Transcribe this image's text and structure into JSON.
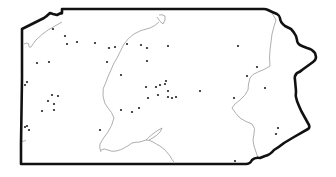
{
  "map": {
    "region": "Pennsylvania",
    "colors": {
      "background": "#ffffff",
      "outline": "#111111",
      "rivers": "#9a9a9a",
      "dots": "#222222"
    },
    "outline_path": "M22,29 L22,78 L21,144 L21,164 L246,164 Q250,164 252,160 Q255,157 260,158 L265,156 Q270,155 274,150 Q279,147 284,143 L294,137 L308,129 Q310,128 309,125 L304,116 Q301,111 299,106 L297,101 Q295,96 296,91 L295,80 Q294,76 297,73 Q300,72 302,70 L313,62 Q316,60 316,57 L315,53 Q312,49 307,48 L302,46 Q297,44 297,40 L296,36 Q294,32 291,29 L285,26 Q280,22 280,18 Q280,16 277,14 Q272,12 268,10 Q266,9 264,9 L62,9 L62,13 Q62,14 61,13 L57,15 L53,14 L50,13 Q47,16 44,18 L40,20 L22,29 Z",
    "rivers": [
      {
        "name": "allegheny-north",
        "d": "M62,22 Q55,26 48,30 Q42,34 36,40 Q33,44 31,47 Q28,48 29,44 Q27,42 24,44"
      },
      {
        "name": "west-branch-susquehanna",
        "d": "M159,22 Q155,26 150,28 Q140,30 134,34 Q128,38 124,44 Q120,52 117,58 Q113,64 111,70 Q108,76 106,82"
      },
      {
        "name": "susquehanna-main",
        "d": "M157,17 Q160,22 163,24 Q166,20 165,16 Q162,14 159,15"
      },
      {
        "name": "juniata-susquehanna",
        "d": "M106,82 Q102,88 103,96 Q104,104 108,108 Q112,112 114,118 Q112,126 108,132 Q103,138 100,144 Q99,148 101,152"
      },
      {
        "name": "potomac-headwaters",
        "d": "M101,150 Q104,148 108,150 Q112,152 116,151 Q121,150 124,148 Q128,146 132,143 Q136,142 140,142 Q143,141 146,140 Q150,140 153,142 Q156,144 160,146 Q166,150 170,156 Q172,160 174,162"
      },
      {
        "name": "potomac-loop",
        "d": "M146,140 Q150,136 154,133 Q158,130 162,128 Q161,132 157,135 Q153,138 149,140"
      },
      {
        "name": "delaware-upper",
        "d": "M270,10 Q274,16 276,20 Q274,26 272,34 Q271,42 270,50 Q269,58 270,66 Q264,70 258,72 Q252,74 250,78 Q248,84 248,90 Q245,96 240,100 Q234,104 232,108"
      },
      {
        "name": "lehigh-schuylkill",
        "d": "M232,108 Q236,114 240,118 Q246,122 252,124 Q256,128 254,134 Q252,140 254,146 Q256,152 258,158"
      },
      {
        "name": "sw-branch",
        "d": "M21,140 Q24,143 26,140"
      }
    ],
    "points": [
      {
        "x": 53,
        "y": 29
      },
      {
        "x": 65,
        "y": 36
      },
      {
        "x": 67,
        "y": 44
      },
      {
        "x": 77,
        "y": 42
      },
      {
        "x": 95,
        "y": 43
      },
      {
        "x": 109,
        "y": 48
      },
      {
        "x": 115,
        "y": 47
      },
      {
        "x": 127,
        "y": 44
      },
      {
        "x": 141,
        "y": 45
      },
      {
        "x": 147,
        "y": 48
      },
      {
        "x": 37,
        "y": 63
      },
      {
        "x": 49,
        "y": 62
      },
      {
        "x": 107,
        "y": 62
      },
      {
        "x": 147,
        "y": 61
      },
      {
        "x": 168,
        "y": 46
      },
      {
        "x": 238,
        "y": 46
      },
      {
        "x": 257,
        "y": 67
      },
      {
        "x": 247,
        "y": 76
      },
      {
        "x": 265,
        "y": 88
      },
      {
        "x": 234,
        "y": 98
      },
      {
        "x": 27,
        "y": 82
      },
      {
        "x": 25,
        "y": 85
      },
      {
        "x": 52,
        "y": 95
      },
      {
        "x": 58,
        "y": 96
      },
      {
        "x": 48,
        "y": 101
      },
      {
        "x": 54,
        "y": 104
      },
      {
        "x": 42,
        "y": 111
      },
      {
        "x": 54,
        "y": 110
      },
      {
        "x": 121,
        "y": 75
      },
      {
        "x": 146,
        "y": 87
      },
      {
        "x": 156,
        "y": 87
      },
      {
        "x": 160,
        "y": 85
      },
      {
        "x": 165,
        "y": 84
      },
      {
        "x": 166,
        "y": 81
      },
      {
        "x": 168,
        "y": 91
      },
      {
        "x": 158,
        "y": 95
      },
      {
        "x": 168,
        "y": 97
      },
      {
        "x": 172,
        "y": 98
      },
      {
        "x": 176,
        "y": 97
      },
      {
        "x": 148,
        "y": 98
      },
      {
        "x": 200,
        "y": 91
      },
      {
        "x": 132,
        "y": 112
      },
      {
        "x": 139,
        "y": 108
      },
      {
        "x": 121,
        "y": 110
      },
      {
        "x": 25,
        "y": 127
      },
      {
        "x": 27,
        "y": 126
      },
      {
        "x": 29,
        "y": 130
      },
      {
        "x": 100,
        "y": 130
      },
      {
        "x": 235,
        "y": 161
      },
      {
        "x": 278,
        "y": 128
      },
      {
        "x": 276,
        "y": 134
      }
    ]
  }
}
